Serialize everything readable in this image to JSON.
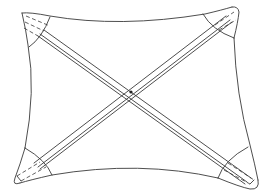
{
  "figure": {
    "title": "",
    "stroke_color": "#3a3a3a",
    "background": "#ffffff",
    "parts": [
      {
        "name": "sail-outline",
        "type": "curved quadrilateral"
      },
      {
        "name": "batten-top-left-to-bottom-right",
        "type": "diagonal strut"
      },
      {
        "name": "batten-top-right-to-bottom-left",
        "type": "diagonal strut"
      },
      {
        "name": "corner-pocket-top-left"
      },
      {
        "name": "corner-pocket-top-right"
      },
      {
        "name": "corner-pocket-bottom-left"
      },
      {
        "name": "corner-pocket-bottom-right"
      },
      {
        "name": "center-joint",
        "type": "dot"
      }
    ]
  }
}
